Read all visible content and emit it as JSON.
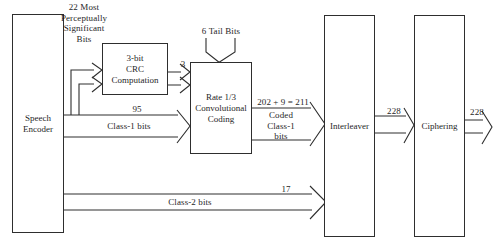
{
  "diagram": {
    "blocks": {
      "speech_encoder": {
        "label": "Speech\nEncoder"
      },
      "crc": {
        "label": "3-bit\nCRC\nComputation"
      },
      "conv": {
        "label": "Rate 1/3\nConvolutional\nCoding"
      },
      "interleaver": {
        "label": "Interleaver"
      },
      "ciphering": {
        "label": "Ciphering"
      }
    },
    "annotations": {
      "msb_bits": "22 Most\nPerceptually\nSignificant\nBits",
      "tail_bits": "6 Tail Bits",
      "crc_bits_count": "3",
      "class1_count": "95",
      "class1_label": "Class-1 bits",
      "coded_sum": "202 + 9 = 211",
      "coded_label": "Coded\nClass-1\nbits",
      "interleaver_out_count": "228",
      "ciphering_out_count": "228",
      "class2_count": "17",
      "class2_label": "Class-2 bits"
    },
    "colors": {
      "line": "#2e2e2e",
      "text": "#1f1f1f",
      "background": "#ffffff"
    }
  }
}
